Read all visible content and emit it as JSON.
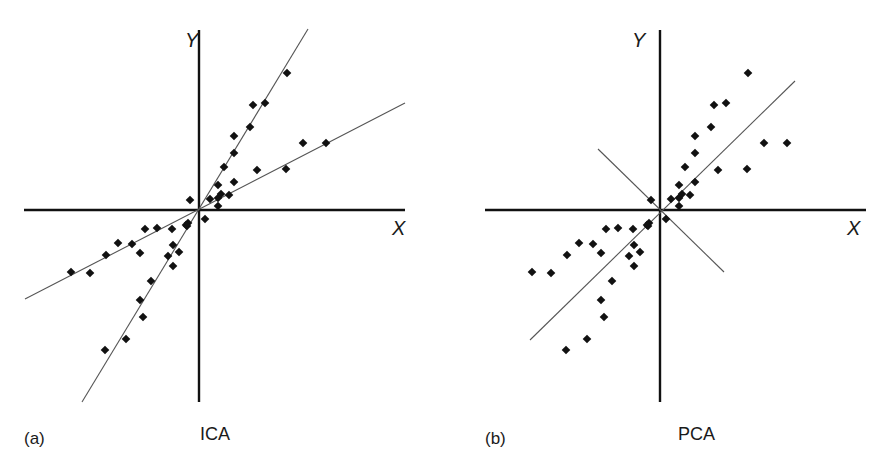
{
  "figure": {
    "panels": [
      {
        "id": "a",
        "panel_label": "(a)",
        "method_label": "ICA",
        "x_axis_label": "X",
        "y_axis_label": "Y",
        "origin_px": [
          199,
          210
        ],
        "x_axis_px": [
          24,
          405
        ],
        "y_axis_px": [
          30,
          402
        ],
        "label_pos": {
          "Y": [
            185,
            47
          ],
          "X": [
            392,
            235
          ],
          "method": [
            200,
            440
          ],
          "panel": [
            24,
            444
          ]
        },
        "lines": [
          {
            "name": "ica-direction-1-steep",
            "from": [
              82,
              402
            ],
            "to": [
              308,
              29
            ]
          },
          {
            "name": "ica-direction-2-shallow",
            "from": [
              25,
              299
            ],
            "to": [
              405,
              103
            ]
          }
        ]
      },
      {
        "id": "b",
        "panel_label": "(b)",
        "method_label": "PCA",
        "x_axis_label": "X",
        "y_axis_label": "Y",
        "origin_px": [
          660,
          210
        ],
        "x_axis_px": [
          485,
          866
        ],
        "y_axis_px": [
          30,
          402
        ],
        "label_pos": {
          "Y": [
            632,
            47
          ],
          "X": [
            847,
            235
          ],
          "method": [
            678,
            440
          ],
          "panel": [
            485,
            444
          ]
        },
        "lines": [
          {
            "name": "pca-principal-component-1",
            "from": [
              530,
              340
            ],
            "to": [
              795,
              81
            ]
          },
          {
            "name": "pca-principal-component-2",
            "from": [
              598,
              149
            ],
            "to": [
              724,
              272
            ]
          }
        ]
      }
    ],
    "colors": {
      "axis": "#111111",
      "line": "#555555",
      "point": "#111111",
      "background": "#ffffff"
    }
  },
  "chart_data": [
    {
      "type": "scatter",
      "title": "ICA",
      "panel": "(a)",
      "xlabel": "X",
      "ylabel": "Y",
      "grid": false,
      "units": "pixel offsets from origin (y up)",
      "points": [
        [
          88,
          137
        ],
        [
          54,
          105
        ],
        [
          66,
          107
        ],
        [
          51,
          83
        ],
        [
          35,
          74
        ],
        [
          35,
          57
        ],
        [
          25,
          43
        ],
        [
          19,
          25
        ],
        [
          35,
          28
        ],
        [
          58,
          40
        ],
        [
          87,
          41
        ],
        [
          104,
          67
        ],
        [
          127,
          67
        ],
        [
          19,
          12
        ],
        [
          11,
          11
        ],
        [
          30,
          15
        ],
        [
          22,
          16
        ],
        [
          -9,
          10
        ],
        [
          19,
          4
        ],
        [
          -11,
          -13
        ],
        [
          6,
          -9
        ],
        [
          -12,
          -16
        ],
        [
          -13,
          -15
        ],
        [
          -54,
          -19
        ],
        [
          -42,
          -18
        ],
        [
          -27,
          -19
        ],
        [
          -81,
          -33
        ],
        [
          -67,
          -34
        ],
        [
          -93,
          -45
        ],
        [
          -59,
          -43
        ],
        [
          -26,
          -35
        ],
        [
          -20,
          -42
        ],
        [
          -31,
          -46
        ],
        [
          -26,
          -56
        ],
        [
          -128,
          -62
        ],
        [
          -109,
          -63
        ],
        [
          -48,
          -71
        ],
        [
          -59,
          -90
        ],
        [
          -56,
          -107
        ],
        [
          -73,
          -129
        ],
        [
          -94,
          -140
        ]
      ],
      "basis_lines": [
        {
          "name": "independent component 1",
          "slope": 1.65
        },
        {
          "name": "independent component 2",
          "slope": 0.52
        }
      ]
    },
    {
      "type": "scatter",
      "title": "PCA",
      "panel": "(b)",
      "xlabel": "X",
      "ylabel": "Y",
      "grid": false,
      "units": "pixel offsets from origin (y up)",
      "points": [
        [
          88,
          137
        ],
        [
          54,
          105
        ],
        [
          66,
          107
        ],
        [
          51,
          83
        ],
        [
          35,
          74
        ],
        [
          35,
          57
        ],
        [
          25,
          43
        ],
        [
          19,
          25
        ],
        [
          35,
          28
        ],
        [
          58,
          40
        ],
        [
          87,
          41
        ],
        [
          104,
          67
        ],
        [
          127,
          67
        ],
        [
          19,
          12
        ],
        [
          11,
          11
        ],
        [
          30,
          15
        ],
        [
          22,
          16
        ],
        [
          -9,
          10
        ],
        [
          19,
          4
        ],
        [
          -11,
          -13
        ],
        [
          6,
          -9
        ],
        [
          -12,
          -16
        ],
        [
          -13,
          -15
        ],
        [
          -54,
          -19
        ],
        [
          -42,
          -18
        ],
        [
          -27,
          -19
        ],
        [
          -81,
          -33
        ],
        [
          -67,
          -34
        ],
        [
          -93,
          -45
        ],
        [
          -59,
          -43
        ],
        [
          -26,
          -35
        ],
        [
          -20,
          -42
        ],
        [
          -31,
          -46
        ],
        [
          -26,
          -56
        ],
        [
          -128,
          -62
        ],
        [
          -109,
          -63
        ],
        [
          -48,
          -71
        ],
        [
          -59,
          -90
        ],
        [
          -56,
          -107
        ],
        [
          -73,
          -129
        ],
        [
          -94,
          -140
        ]
      ],
      "basis_lines": [
        {
          "name": "principal component 1",
          "slope": 0.98
        },
        {
          "name": "principal component 2",
          "slope": -0.98
        }
      ]
    }
  ]
}
